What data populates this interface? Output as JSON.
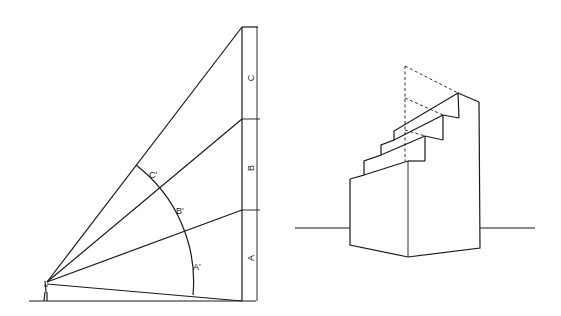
{
  "figure_left": {
    "description": "Visual angle construction: observer eye at ground level, rays to divisions of a vertical building face, arc showing angular sizes",
    "segment_labels": [
      "A",
      "B",
      "C"
    ],
    "arc_labels": [
      "A'",
      "B'",
      "C'"
    ]
  },
  "figure_right": {
    "description": "Two-point perspective drawing of a stepped block (staircase) on a horizon line, with dashed construction lines"
  },
  "colors": {
    "background": "#ffffff",
    "ink": "#1a1a1a"
  }
}
